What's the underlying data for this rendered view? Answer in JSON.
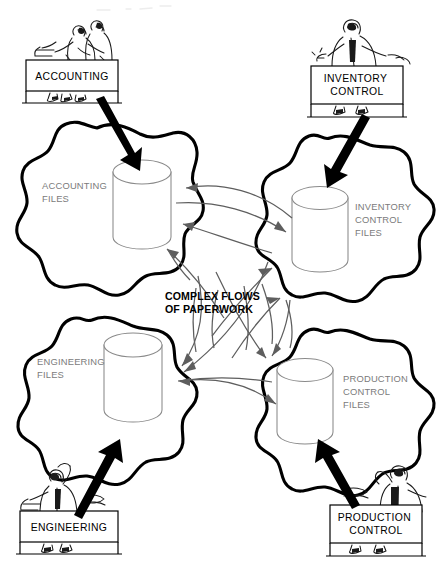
{
  "diagram": {
    "background_color": "#ffffff",
    "blob_outline_color": "#000000",
    "flow_line_color": "#5e5e5e",
    "cylinder_color": "#8a8a8a",
    "files_label_color": "#7b7b7b",
    "dept_label_color": "#000000"
  },
  "center_note": {
    "line1": "COMPLEX FLOWS",
    "line2": "OF PAPERWORK"
  },
  "departments": [
    {
      "id": "accounting",
      "label": "ACCOUNTING",
      "label_line1": "ACCOUNTING",
      "label_line2": "",
      "position": "top-left"
    },
    {
      "id": "inventory-control",
      "label": "INVENTORY CONTROL",
      "label_line1": "INVENTORY",
      "label_line2": "CONTROL",
      "position": "top-right"
    },
    {
      "id": "engineering",
      "label": "ENGINEERING",
      "label_line1": "ENGINEERING",
      "label_line2": "",
      "position": "bottom-left"
    },
    {
      "id": "production-control",
      "label": "PRODUCTION CONTROL",
      "label_line1": "PRODUCTION",
      "label_line2": "CONTROL",
      "position": "bottom-right"
    }
  ],
  "file_stores": [
    {
      "id": "accounting-files",
      "label": "ACCOUNTING FILES",
      "label_line1": "ACCOUNTING",
      "label_line2": "FILES",
      "label_line3": "",
      "position": "upper-left"
    },
    {
      "id": "inventory-control-files",
      "label": "INVENTORY CONTROL FILES",
      "label_line1": "INVENTORY",
      "label_line2": "CONTROL",
      "label_line3": "FILES",
      "position": "upper-right"
    },
    {
      "id": "engineering-files",
      "label": "ENGINEERING FILES",
      "label_line1": "ENGINEERING",
      "label_line2": "FILES",
      "label_line3": "",
      "position": "lower-left"
    },
    {
      "id": "production-control-files",
      "label": "PRODUCTION CONTROL FILES",
      "label_line1": "PRODUCTION",
      "label_line2": "CONTROL",
      "label_line3": "FILES",
      "position": "lower-right"
    }
  ],
  "department_to_files_arrows": [
    {
      "from": "accounting",
      "to": "accounting-files",
      "style": "thick-black"
    },
    {
      "from": "inventory-control",
      "to": "inventory-control-files",
      "style": "thick-black"
    },
    {
      "from": "engineering",
      "to": "engineering-files",
      "style": "thick-black"
    },
    {
      "from": "production-control",
      "to": "production-control-files",
      "style": "thick-black"
    }
  ],
  "paperwork_flows": [
    {
      "from": "inventory-control-files",
      "to": "accounting-files",
      "style": "thin-gray-curve"
    },
    {
      "from": "accounting-files",
      "to": "inventory-control-files",
      "style": "thin-gray-curve"
    },
    {
      "from": "production-control-files",
      "to": "accounting-files",
      "style": "thin-gray-curve"
    },
    {
      "from": "engineering-files",
      "to": "accounting-files",
      "style": "thin-gray-curve"
    },
    {
      "from": "engineering-files",
      "to": "inventory-control-files",
      "style": "thin-gray-curve"
    },
    {
      "from": "production-control-files",
      "to": "inventory-control-files",
      "style": "thin-gray-curve"
    },
    {
      "from": "accounting-files",
      "to": "engineering-files",
      "style": "thin-gray-curve"
    },
    {
      "from": "inventory-control-files",
      "to": "engineering-files",
      "style": "thin-gray-curve"
    },
    {
      "from": "accounting-files",
      "to": "production-control-files",
      "style": "thin-gray-curve"
    },
    {
      "from": "inventory-control-files",
      "to": "production-control-files",
      "style": "thin-gray-curve"
    },
    {
      "from": "engineering-files",
      "to": "production-control-files",
      "style": "thin-gray-curve"
    }
  ]
}
